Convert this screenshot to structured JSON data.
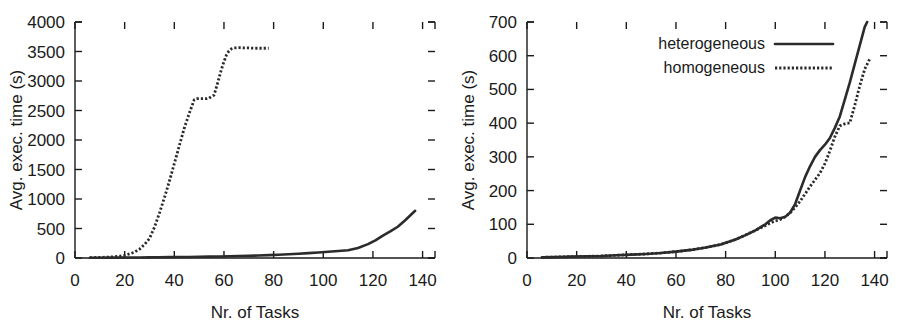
{
  "figure": {
    "background": "#ffffff",
    "ink_color": "#2b2b2b",
    "panel_count": 2
  },
  "chart_data": [
    {
      "id": "left-panel",
      "type": "line",
      "title": "",
      "xlabel": "Nr. of Tasks",
      "ylabel": "Avg. exec. time (s)",
      "xlim": [
        0,
        145
      ],
      "ylim": [
        0,
        4000
      ],
      "xticks": [
        0,
        20,
        40,
        60,
        80,
        100,
        120,
        140
      ],
      "xticklabels": [
        "0",
        "20",
        "40",
        "60",
        "80",
        "100",
        "120",
        "140"
      ],
      "yticks": [
        0,
        500,
        1000,
        1500,
        2000,
        2500,
        3000,
        3500,
        4000
      ],
      "yticklabels": [
        "0",
        "500",
        "1000",
        "1500",
        "2000",
        "2500",
        "3000",
        "3500",
        "4000"
      ],
      "grid": false,
      "legend": null,
      "series": [
        {
          "name": "heterogeneous",
          "style": "solid",
          "color": "#2b2b2b",
          "x": [
            6,
            10,
            14,
            18,
            22,
            26,
            30,
            34,
            38,
            42,
            46,
            50,
            54,
            58,
            62,
            66,
            70,
            74,
            78,
            82,
            86,
            90,
            94,
            98,
            102,
            106,
            110,
            114,
            118,
            121,
            124,
            127,
            130,
            133,
            135,
            137
          ],
          "y": [
            4,
            5,
            6,
            7,
            8,
            9,
            11,
            12,
            14,
            16,
            18,
            20,
            23,
            26,
            29,
            33,
            37,
            42,
            48,
            55,
            63,
            72,
            82,
            93,
            105,
            118,
            132,
            170,
            235,
            300,
            380,
            450,
            530,
            640,
            720,
            800
          ]
        },
        {
          "name": "homogeneous",
          "style": "dotted",
          "color": "#2b2b2b",
          "x": [
            6,
            10,
            14,
            18,
            20,
            22,
            24,
            26,
            28,
            30,
            32,
            34,
            36,
            38,
            40,
            42,
            44,
            46,
            48,
            49,
            50,
            51,
            52,
            53,
            54,
            55,
            56,
            57,
            58,
            59,
            60,
            61,
            62,
            63,
            64,
            66,
            68,
            70,
            72,
            74,
            76,
            78
          ],
          "y": [
            6,
            10,
            16,
            30,
            45,
            70,
            100,
            150,
            230,
            330,
            520,
            760,
            1020,
            1300,
            1600,
            1900,
            2200,
            2450,
            2680,
            2700,
            2700,
            2700,
            2700,
            2700,
            2710,
            2740,
            2760,
            2900,
            3050,
            3200,
            3330,
            3440,
            3510,
            3545,
            3560,
            3565,
            3560,
            3560,
            3555,
            3555,
            3555,
            3555
          ]
        }
      ]
    },
    {
      "id": "right-panel",
      "type": "line",
      "title": "",
      "xlabel": "Nr. of Tasks",
      "ylabel": "Avg. exec. time (s)",
      "xlim": [
        0,
        145
      ],
      "ylim": [
        0,
        700
      ],
      "xticks": [
        0,
        20,
        40,
        60,
        80,
        100,
        120,
        140
      ],
      "xticklabels": [
        "0",
        "20",
        "40",
        "60",
        "80",
        "100",
        "120",
        "140"
      ],
      "yticks": [
        0,
        100,
        200,
        300,
        400,
        500,
        600,
        700
      ],
      "yticklabels": [
        "0",
        "100",
        "200",
        "300",
        "400",
        "500",
        "600",
        "700"
      ],
      "grid": false,
      "legend": {
        "position": "top-left-inside",
        "entries": [
          {
            "label": "heterogeneous",
            "style": "solid",
            "color": "#2b2b2b"
          },
          {
            "label": "homogeneous",
            "style": "dotted",
            "color": "#2b2b2b"
          }
        ]
      },
      "series": [
        {
          "name": "heterogeneous",
          "style": "solid",
          "color": "#2b2b2b",
          "x": [
            6,
            12,
            18,
            24,
            30,
            36,
            42,
            48,
            54,
            60,
            66,
            72,
            78,
            84,
            88,
            92,
            96,
            98,
            100,
            102,
            104,
            106,
            108,
            110,
            112,
            114,
            116,
            118,
            120,
            122,
            124,
            126,
            128,
            130,
            132,
            134,
            136,
            137
          ],
          "y": [
            2,
            3,
            4,
            5,
            6,
            8,
            10,
            12,
            15,
            19,
            24,
            31,
            40,
            55,
            68,
            82,
            100,
            112,
            120,
            118,
            122,
            135,
            160,
            200,
            240,
            272,
            300,
            320,
            336,
            356,
            386,
            420,
            470,
            520,
            575,
            630,
            685,
            700
          ]
        },
        {
          "name": "homogeneous",
          "style": "dotted",
          "color": "#2b2b2b",
          "x": [
            6,
            12,
            18,
            24,
            30,
            36,
            42,
            48,
            54,
            60,
            66,
            72,
            78,
            84,
            88,
            92,
            96,
            98,
            100,
            102,
            104,
            106,
            108,
            110,
            112,
            114,
            116,
            118,
            120,
            122,
            124,
            126,
            128,
            129,
            130,
            132,
            134,
            136,
            138
          ],
          "y": [
            2,
            3,
            4,
            5,
            6,
            8,
            10,
            12,
            15,
            19,
            24,
            31,
            40,
            55,
            68,
            82,
            96,
            104,
            110,
            114,
            122,
            134,
            150,
            168,
            190,
            212,
            232,
            252,
            280,
            318,
            360,
            392,
            398,
            400,
            400,
            452,
            510,
            560,
            590
          ]
        }
      ]
    }
  ]
}
